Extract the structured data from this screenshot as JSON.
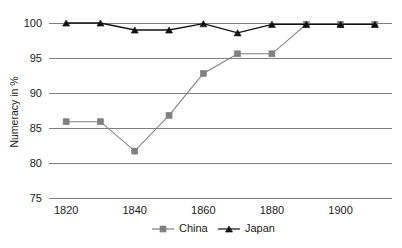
{
  "chart_data": {
    "type": "line",
    "title": "",
    "subtitle": "",
    "xlabel": "",
    "ylabel": "Numeracy in %",
    "x": [
      1820,
      1830,
      1840,
      1850,
      1860,
      1870,
      1880,
      1890,
      1900,
      1910
    ],
    "series": [
      {
        "name": "China",
        "marker": "square",
        "color": "#808080",
        "values": [
          85.9,
          85.9,
          81.7,
          86.8,
          92.8,
          95.6,
          95.6,
          99.8,
          99.8,
          99.8
        ]
      },
      {
        "name": "Japan",
        "marker": "triangle",
        "color": "#111111",
        "values": [
          100.0,
          100.0,
          99.0,
          99.0,
          99.9,
          98.6,
          99.8,
          99.8,
          99.8,
          99.8
        ]
      }
    ],
    "xlim": [
      1815,
      1915
    ],
    "ylim": [
      75,
      101
    ],
    "yticks": [
      75,
      80,
      85,
      90,
      95,
      100
    ],
    "ytick_labels": [
      "75",
      "80",
      "85",
      "90",
      "95",
      "100"
    ],
    "xticks": [
      1820,
      1840,
      1860,
      1880,
      1900
    ],
    "xtick_labels": [
      "1820",
      "1840",
      "1860",
      "1880",
      "1900"
    ],
    "grid": "horizontal",
    "legend_position": "bottom-center",
    "legend": [
      "China",
      "Japan"
    ],
    "background_color": "#ffffff",
    "gridline_color": "#808080"
  },
  "legend": {
    "items": [
      {
        "label": "China"
      },
      {
        "label": "Japan"
      }
    ]
  },
  "axes": {
    "y_title": "Numeracy in %"
  }
}
